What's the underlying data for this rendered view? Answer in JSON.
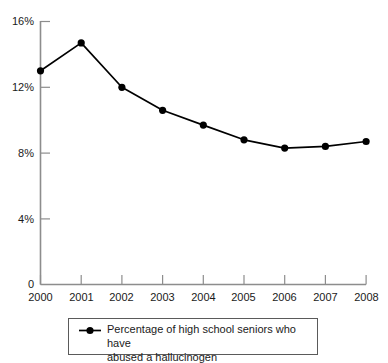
{
  "chart_data": {
    "type": "line",
    "title": "",
    "subtitle": "",
    "xlabel": "",
    "ylabel": "",
    "categories": [
      "2000",
      "2001",
      "2002",
      "2003",
      "2004",
      "2005",
      "2006",
      "2007",
      "2008"
    ],
    "x": [
      2000,
      2001,
      2002,
      2003,
      2004,
      2005,
      2006,
      2007,
      2008
    ],
    "series": [
      {
        "name": "Percentage of high school seniors who have abused a hallucinogen",
        "values": [
          13.0,
          14.7,
          12.0,
          10.6,
          9.7,
          8.8,
          8.3,
          8.4,
          8.7
        ],
        "color": "#000000",
        "marker": "circle",
        "line_width": 1.6
      }
    ],
    "ylim": [
      0,
      16
    ],
    "xlim": [
      2000,
      2008
    ],
    "ytick_values": [
      0,
      4,
      8,
      12,
      16
    ],
    "ytick_labels": [
      "0",
      "4%",
      "8%",
      "12%",
      "16%"
    ],
    "xtick_labels": [
      "2000",
      "2001",
      "2002",
      "2003",
      "2004",
      "2005",
      "2006",
      "2007",
      "2008"
    ],
    "grid": false,
    "legend_position": "below-center",
    "axis_color": "#8d8d8d",
    "text_color": "#1a1a1a",
    "background": "#ffffff"
  },
  "legend": {
    "entries": [
      {
        "label_line1": "Percentage of high school seniors who have",
        "label_line2": "abused a hallucinogen",
        "marker": "line-with-dot",
        "color": "#000000"
      }
    ]
  },
  "axes": {
    "y_labels": [
      "16%",
      "12%",
      "8%",
      "4%",
      "0"
    ],
    "x_labels": [
      "2000",
      "2001",
      "2002",
      "2003",
      "2004",
      "2005",
      "2006",
      "2007",
      "2008"
    ]
  }
}
